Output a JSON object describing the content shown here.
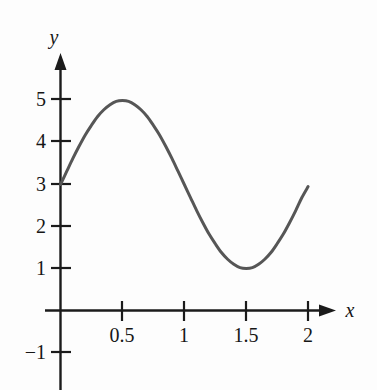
{
  "chart_data": {
    "type": "line",
    "title": "",
    "subtitle": "",
    "xlabel": "x",
    "ylabel": "y",
    "xlim": [
      0,
      2.15
    ],
    "ylim": [
      -1.35,
      5.6
    ],
    "grid": false,
    "legend": null,
    "x_ticks": [
      {
        "value": 0.5,
        "label": "0.5"
      },
      {
        "value": 1,
        "label": "1"
      },
      {
        "value": 1.5,
        "label": "1.5"
      },
      {
        "value": 2,
        "label": "2"
      }
    ],
    "y_ticks": [
      {
        "value": -1,
        "label": "−1"
      },
      {
        "value": 1,
        "label": "1"
      },
      {
        "value": 2,
        "label": "2"
      },
      {
        "value": 3,
        "label": "3"
      },
      {
        "value": 4,
        "label": "4"
      },
      {
        "value": 5,
        "label": "5"
      }
    ],
    "series": [
      {
        "name": "curve",
        "color": "#565656",
        "expression": "y = 3 + 2 sin(pi x)",
        "x": [
          0,
          0.05,
          0.1,
          0.15,
          0.2,
          0.25,
          0.3,
          0.35,
          0.4,
          0.45,
          0.5,
          0.55,
          0.6,
          0.65,
          0.7,
          0.75,
          0.8,
          0.85,
          0.9,
          0.95,
          1.0,
          1.05,
          1.1,
          1.15,
          1.2,
          1.25,
          1.3,
          1.35,
          1.4,
          1.45,
          1.5,
          1.55,
          1.6,
          1.65,
          1.7,
          1.75,
          1.8,
          1.85,
          1.9,
          1.95,
          2.0
        ],
        "y": [
          3.0,
          3.31,
          3.62,
          3.91,
          4.18,
          4.41,
          4.62,
          4.78,
          4.9,
          4.98,
          5.0,
          4.98,
          4.9,
          4.78,
          4.62,
          4.41,
          4.18,
          3.91,
          3.62,
          3.31,
          3.0,
          2.69,
          2.38,
          2.09,
          1.82,
          1.59,
          1.38,
          1.22,
          1.1,
          1.02,
          1.0,
          1.02,
          1.1,
          1.22,
          1.38,
          1.59,
          1.82,
          2.09,
          2.38,
          2.69,
          2.95
        ]
      }
    ],
    "annotations": [],
    "notable_points": [
      {
        "label": "start",
        "x": 0,
        "y": 3
      },
      {
        "label": "maximum",
        "x": 0.5,
        "y": 5
      },
      {
        "label": "midpoint",
        "x": 1,
        "y": 3
      },
      {
        "label": "minimum",
        "x": 1.5,
        "y": 1
      },
      {
        "label": "end",
        "x": 2,
        "y": 2.95
      }
    ]
  },
  "colors": {
    "background": "#fdfdfd",
    "axis": "#1b1b1b",
    "curve": "#565656",
    "text": "#161616"
  }
}
